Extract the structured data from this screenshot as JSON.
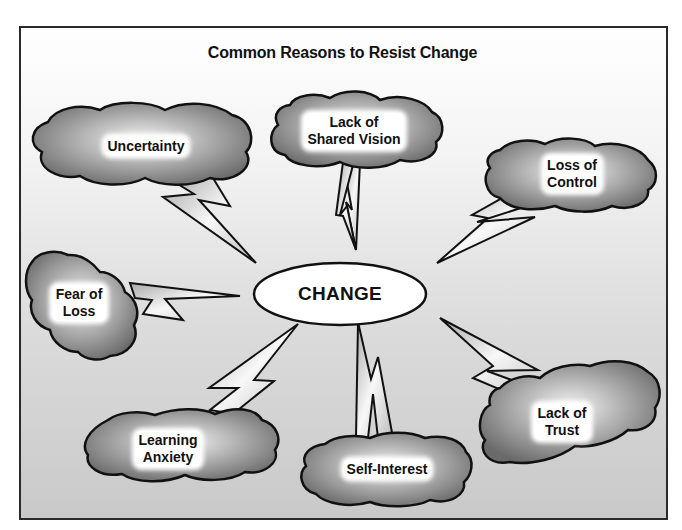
{
  "diagram": {
    "title": "Common Reasons to Resist Change",
    "center": {
      "label": "CHANGE"
    },
    "reasons": [
      {
        "id": "uncertainty",
        "line1": "Uncertainty",
        "line2": ""
      },
      {
        "id": "shared-vision",
        "line1": "Lack of",
        "line2": "Shared Vision"
      },
      {
        "id": "loss-of-control",
        "line1": "Loss of",
        "line2": "Control"
      },
      {
        "id": "fear-of-loss",
        "line1": "Fear of",
        "line2": "Loss"
      },
      {
        "id": "learning-anxiety",
        "line1": "Learning",
        "line2": "Anxiety"
      },
      {
        "id": "self-interest",
        "line1": "Self-Interest",
        "line2": ""
      },
      {
        "id": "lack-of-trust",
        "line1": "Lack of",
        "line2": "Trust"
      }
    ],
    "colors": {
      "outline": "#111111",
      "cloud_light": "#f2f2f2",
      "cloud_dark": "#6e6e6e",
      "bolt_fill": "#d9d9d9",
      "ellipse_fill": "#ffffff"
    }
  }
}
